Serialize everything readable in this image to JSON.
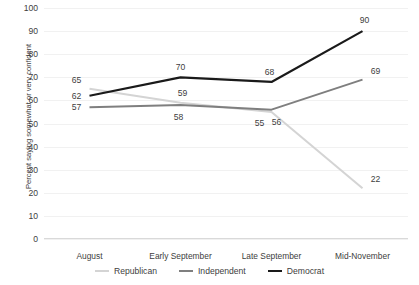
{
  "chart_data": {
    "type": "line",
    "title": "",
    "xlabel": "",
    "ylabel": "Percent saying somewhat or very confident",
    "categories": [
      "August",
      "Early September",
      "Late September",
      "Mid-November"
    ],
    "ylim": [
      0,
      100
    ],
    "ytick_step": 10,
    "yticks": [
      0,
      10,
      20,
      30,
      40,
      50,
      60,
      70,
      80,
      90,
      100
    ],
    "grid": true,
    "legend_position": "bottom",
    "data_labels": true,
    "series": [
      {
        "name": "Republican",
        "color": "#d4d4d4",
        "values": [
          65,
          59,
          55,
          22
        ]
      },
      {
        "name": "Independent",
        "color": "#7f7f7f",
        "values": [
          57,
          58,
          56,
          69
        ]
      },
      {
        "name": "Democrat",
        "color": "#1a1a1a",
        "values": [
          62,
          70,
          68,
          90
        ]
      }
    ],
    "label_offsets": [
      {
        "series": 0,
        "point": 0,
        "dx": -13,
        "dy": -9
      },
      {
        "series": 0,
        "point": 1,
        "dx": 2,
        "dy": -10
      },
      {
        "series": 0,
        "point": 2,
        "dx": -12,
        "dy": 11
      },
      {
        "series": 0,
        "point": 3,
        "dx": 13,
        "dy": -9
      },
      {
        "series": 1,
        "point": 0,
        "dx": -13,
        "dy": 0
      },
      {
        "series": 1,
        "point": 1,
        "dx": -2,
        "dy": 12
      },
      {
        "series": 1,
        "point": 2,
        "dx": 5,
        "dy": 12
      },
      {
        "series": 1,
        "point": 3,
        "dx": 13,
        "dy": -9
      },
      {
        "series": 2,
        "point": 0,
        "dx": -13,
        "dy": 0
      },
      {
        "series": 2,
        "point": 1,
        "dx": 0,
        "dy": -10
      },
      {
        "series": 2,
        "point": 2,
        "dx": -2,
        "dy": -10
      },
      {
        "series": 2,
        "point": 3,
        "dx": 2,
        "dy": -11
      }
    ]
  }
}
